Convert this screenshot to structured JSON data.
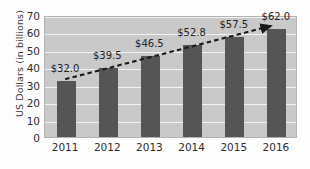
{
  "chart_data": {
    "type": "bar",
    "title": "",
    "subtitle": "",
    "xlabel": "",
    "ylabel": "US Dollars (in billions)",
    "categories": [
      "2011",
      "2012",
      "2013",
      "2014",
      "2015",
      "2016"
    ],
    "values": [
      32.0,
      39.5,
      46.5,
      52.8,
      57.5,
      62.0
    ],
    "data_labels": [
      "$32.0",
      "$39.5",
      "$46.5",
      "$52.8",
      "$57.5",
      "$62.0"
    ],
    "ylim": [
      0,
      70
    ],
    "ytick_labels": [
      "0",
      "10",
      "20",
      "30",
      "40",
      "50",
      "60",
      "70"
    ],
    "ytick_values": [
      0,
      10,
      20,
      30,
      40,
      50,
      60,
      70
    ],
    "grid": true,
    "legend": "none",
    "annotations": [
      {
        "name": "trend-arrow",
        "type": "dashed-line-with-arrowhead",
        "from_category": "2011",
        "to_category": "2016",
        "from_value": 32.0,
        "to_value": 62.0
      }
    ],
    "colors": {
      "bar": "#555555",
      "plot_background": "#c9c9c9",
      "gridline": "#f2f2f2",
      "trend_line": "#1a1a1a",
      "axis_text": "#2e2e2e",
      "page_background": "#fdfdfd"
    }
  }
}
